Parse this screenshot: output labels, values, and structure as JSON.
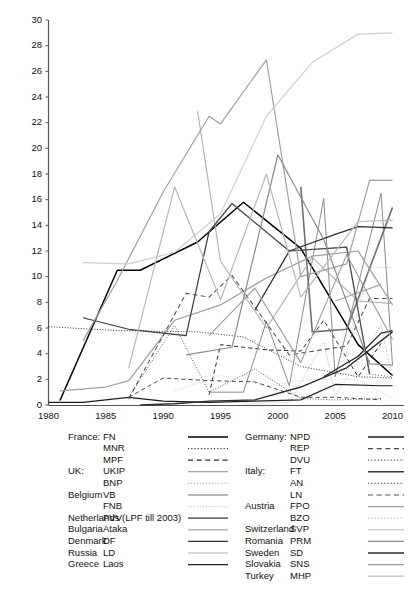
{
  "chart_data": {
    "type": "line",
    "title": "",
    "subtitle": "",
    "xlabel": "",
    "ylabel": "",
    "xlim": [
      1980,
      2011
    ],
    "ylim": [
      0,
      30
    ],
    "grid": false,
    "legend_position": "below",
    "xticks": [
      1980,
      1985,
      1990,
      1995,
      2000,
      2005,
      2010
    ],
    "yticks": [
      0,
      2,
      4,
      6,
      8,
      10,
      12,
      14,
      16,
      18,
      20,
      22,
      24,
      26,
      28,
      30
    ],
    "series": [
      {
        "name": "FN",
        "country": "France",
        "style": "solid",
        "color": "#000000",
        "width": 1.5,
        "points": [
          [
            1981,
            0.35
          ],
          [
            1986,
            10.5
          ],
          [
            1988,
            10.5
          ],
          [
            1993,
            12.7
          ],
          [
            1997,
            15.8
          ],
          [
            2002,
            12.2
          ],
          [
            2007,
            4.7
          ],
          [
            2010,
            2.3
          ]
        ]
      },
      {
        "name": "MNR",
        "country": "France",
        "style": "dotted",
        "color": "#333333",
        "width": 1.0,
        "points": [
          [
            1980,
            6.1
          ],
          [
            1986,
            5.8
          ],
          [
            1993,
            5.7
          ],
          [
            1997,
            5.3
          ],
          [
            2002,
            3.0
          ],
          [
            2007,
            2.2
          ],
          [
            2010,
            2.1
          ]
        ]
      },
      {
        "name": "MPF",
        "country": "France",
        "style": "dashed",
        "color": "#2a2a2a",
        "width": 1.0,
        "points": [
          [
            1994,
            0.8
          ],
          [
            1995,
            4.7
          ],
          [
            1999,
            4.3
          ],
          [
            2002,
            4.2
          ],
          [
            2004,
            6.6
          ],
          [
            2007,
            2.2
          ],
          [
            2009,
            4.8
          ]
        ]
      },
      {
        "name": "UKIP",
        "country": "UK",
        "style": "solid",
        "color": "#8a8a8a",
        "width": 1.0,
        "points": [
          [
            1994,
            1.0
          ],
          [
            1997,
            1.0
          ],
          [
            1999,
            6.5
          ],
          [
            2001,
            1.5
          ],
          [
            2004,
            16.1
          ],
          [
            2005,
            2.2
          ],
          [
            2009,
            16.5
          ],
          [
            2010,
            3.1
          ]
        ]
      },
      {
        "name": "BNP",
        "country": "UK",
        "style": "dotted",
        "color": "#b4b4b4",
        "width": 1.0,
        "points": [
          [
            1997,
            0.1
          ],
          [
            2001,
            0.2
          ],
          [
            2004,
            4.9
          ],
          [
            2005,
            0.7
          ],
          [
            2009,
            6.2
          ],
          [
            2010,
            1.9
          ]
        ]
      },
      {
        "name": "VB",
        "country": "Belgium",
        "style": "solid",
        "color": "#9e9e9e",
        "width": 1.2,
        "points": [
          [
            1981,
            1.1
          ],
          [
            1985,
            1.4
          ],
          [
            1987,
            1.9
          ],
          [
            1991,
            6.6
          ],
          [
            1995,
            7.8
          ],
          [
            1999,
            9.9
          ],
          [
            2003,
            11.6
          ],
          [
            2007,
            12.0
          ],
          [
            2010,
            7.8
          ]
        ]
      },
      {
        "name": "FNB",
        "country": "Belgium",
        "style": "dotted",
        "color": "#c8c8c8",
        "width": 1.0,
        "points": [
          [
            1991,
            1.1
          ],
          [
            1995,
            2.3
          ],
          [
            1999,
            1.5
          ],
          [
            2003,
            2.0
          ],
          [
            2007,
            2.0
          ],
          [
            2010,
            0.5
          ]
        ]
      },
      {
        "name": "PVV(LPF till 2003)",
        "country": "Netherlands",
        "style": "solid",
        "color": "#707070",
        "width": 1.6,
        "points": [
          [
            2002,
            17.0
          ],
          [
            2003,
            5.7
          ],
          [
            2006,
            5.9
          ],
          [
            2010,
            15.4
          ]
        ]
      },
      {
        "name": "Ataka",
        "country": "Bulgaria",
        "style": "solid",
        "color": "#a5a5a5",
        "width": 1.1,
        "points": [
          [
            2005,
            8.1
          ],
          [
            2009,
            9.4
          ]
        ]
      },
      {
        "name": "DF",
        "country": "Denmark",
        "style": "solid",
        "color": "#2e2e2e",
        "width": 1.3,
        "points": [
          [
            1998,
            7.4
          ],
          [
            2001,
            12.0
          ],
          [
            2005,
            13.3
          ],
          [
            2007,
            13.9
          ],
          [
            2010,
            13.8
          ]
        ]
      },
      {
        "name": "LD",
        "country": "Russia",
        "style": "solid",
        "color": "#b0b0b0",
        "width": 1.1,
        "points": [
          [
            1993,
            22.9
          ],
          [
            1995,
            11.2
          ],
          [
            1999,
            6.0
          ],
          [
            2003,
            11.5
          ],
          [
            2007,
            8.1
          ],
          [
            2010,
            7.9
          ]
        ]
      },
      {
        "name": "Laos",
        "country": "Greece",
        "style": "solid",
        "color": "#222222",
        "width": 1.3,
        "points": [
          [
            2004,
            2.2
          ],
          [
            2007,
            3.8
          ],
          [
            2009,
            5.6
          ],
          [
            2010,
            5.8
          ]
        ]
      },
      {
        "name": "NPD",
        "country": "Germany",
        "style": "solid",
        "color": "#1c1c1c",
        "width": 1.2,
        "points": [
          [
            1980,
            0.2
          ],
          [
            1983,
            0.2
          ],
          [
            1987,
            0.6
          ],
          [
            1990,
            0.3
          ],
          [
            1994,
            0.2
          ],
          [
            1998,
            0.3
          ],
          [
            2002,
            0.4
          ],
          [
            2005,
            1.6
          ],
          [
            2009,
            1.5
          ],
          [
            2010,
            1.5
          ]
        ]
      },
      {
        "name": "REP",
        "country": "Germany",
        "style": "dashed",
        "color": "#4a4a4a",
        "width": 1.0,
        "points": [
          [
            1987,
            0.6
          ],
          [
            1990,
            2.1
          ],
          [
            1994,
            1.9
          ],
          [
            1998,
            1.8
          ],
          [
            2002,
            0.6
          ],
          [
            2005,
            0.6
          ],
          [
            2009,
            0.4
          ]
        ]
      },
      {
        "name": "DVU",
        "country": "Germany",
        "style": "dotted",
        "color": "#5a5a5a",
        "width": 1.0,
        "points": [
          [
            1987,
            0.6
          ],
          [
            1991,
            6.2
          ],
          [
            1994,
            1.0
          ],
          [
            1998,
            2.8
          ],
          [
            2002,
            0.5
          ],
          [
            2005,
            0.4
          ],
          [
            2009,
            0.5
          ]
        ]
      },
      {
        "name": "FT",
        "country": "Italy",
        "style": "solid",
        "color": "#3a3a3a",
        "width": 1.2,
        "points": [
          [
            1983,
            6.8
          ],
          [
            1987,
            5.9
          ],
          [
            1992,
            5.4
          ],
          [
            1994,
            13.5
          ],
          [
            1996,
            15.7
          ],
          [
            2001,
            12.0
          ],
          [
            2006,
            12.3
          ],
          [
            2008,
            2.4
          ]
        ]
      },
      {
        "name": "AN",
        "country": "Italy",
        "style": "dotted",
        "color": "#6a6a6a",
        "width": 1.1,
        "points": [
          [
            1994,
            13.5
          ],
          [
            1996,
            15.7
          ],
          [
            2001,
            12.0
          ],
          [
            2006,
            12.3
          ],
          [
            2008,
            2.4
          ],
          [
            2010,
            2.2
          ]
        ]
      },
      {
        "name": "LN",
        "country": "Italy",
        "style": "dashed",
        "color": "#555555",
        "width": 1.1,
        "points": [
          [
            1987,
            0.5
          ],
          [
            1992,
            8.7
          ],
          [
            1994,
            8.4
          ],
          [
            1996,
            10.1
          ],
          [
            2001,
            3.9
          ],
          [
            2006,
            4.6
          ],
          [
            2008,
            8.3
          ],
          [
            2010,
            8.3
          ]
        ]
      },
      {
        "name": "FPO",
        "country": "Austria",
        "style": "solid",
        "color": "#a0a0a0",
        "width": 1.2,
        "points": [
          [
            1983,
            5.0
          ],
          [
            1986,
            9.7
          ],
          [
            1990,
            16.6
          ],
          [
            1994,
            22.5
          ],
          [
            1995,
            21.9
          ],
          [
            1999,
            26.9
          ],
          [
            2002,
            10.0
          ],
          [
            2006,
            11.0
          ],
          [
            2008,
            17.5
          ],
          [
            2010,
            17.5
          ]
        ]
      },
      {
        "name": "BZO",
        "country": "Austria",
        "style": "dotted",
        "color": "#bdbdbd",
        "width": 1.0,
        "points": [
          [
            2006,
            4.1
          ],
          [
            2008,
            10.7
          ],
          [
            2010,
            10.7
          ]
        ]
      },
      {
        "name": "SVP",
        "country": "Switzerland",
        "style": "solid",
        "color": "#cfcfcf",
        "width": 1.2,
        "points": [
          [
            1983,
            11.1
          ],
          [
            1987,
            11.0
          ],
          [
            1991,
            11.9
          ],
          [
            1995,
            14.9
          ],
          [
            1999,
            22.5
          ],
          [
            2003,
            26.7
          ],
          [
            2007,
            28.9
          ],
          [
            2010,
            29.0
          ]
        ]
      },
      {
        "name": "PRM",
        "country": "Romania",
        "style": "solid",
        "color": "#8c8c8c",
        "width": 1.2,
        "points": [
          [
            1992,
            3.9
          ],
          [
            1996,
            4.5
          ],
          [
            2000,
            19.5
          ],
          [
            2004,
            12.9
          ],
          [
            2008,
            3.2
          ],
          [
            2010,
            3.1
          ]
        ]
      },
      {
        "name": "SD",
        "country": "Sweden",
        "style": "solid",
        "color": "#2b2b2b",
        "width": 1.4,
        "points": [
          [
            1988,
            0.0
          ],
          [
            1991,
            0.1
          ],
          [
            1994,
            0.3
          ],
          [
            1998,
            0.4
          ],
          [
            2002,
            1.4
          ],
          [
            2006,
            2.9
          ],
          [
            2010,
            5.7
          ]
        ]
      },
      {
        "name": "SNS",
        "country": "Slovakia",
        "style": "solid",
        "color": "#9a9a9a",
        "width": 1.1,
        "points": [
          [
            1994,
            5.4
          ],
          [
            1998,
            9.1
          ],
          [
            2002,
            3.3
          ],
          [
            2006,
            11.7
          ],
          [
            2010,
            5.1
          ]
        ]
      },
      {
        "name": "MHP",
        "country": "Turkey",
        "style": "solid",
        "color": "#b8b8b8",
        "width": 1.2,
        "points": [
          [
            1987,
            2.9
          ],
          [
            1991,
            17.0
          ],
          [
            1995,
            8.2
          ],
          [
            1999,
            18.0
          ],
          [
            2002,
            8.4
          ],
          [
            2007,
            14.3
          ],
          [
            2010,
            14.4
          ]
        ]
      }
    ]
  },
  "axes": {
    "x_tick_labels": [
      "1980",
      "1985",
      "1990",
      "1995",
      "2000",
      "2005",
      "2010"
    ],
    "y_tick_labels": [
      "0",
      "2",
      "4",
      "6",
      "8",
      "10",
      "12",
      "14",
      "16",
      "18",
      "20",
      "22",
      "24",
      "26",
      "28",
      "30"
    ]
  },
  "legend": {
    "left_column": [
      {
        "country": "France:",
        "party": "FN",
        "style": "solid",
        "color": "#000000",
        "width": 1.7
      },
      {
        "country": "",
        "party": "MNR",
        "style": "dotted",
        "color": "#333333",
        "width": 1.2
      },
      {
        "country": "",
        "party": "MPF",
        "style": "dashed",
        "color": "#2a2a2a",
        "width": 1.2
      },
      {
        "country": "UK:",
        "party": "UKIP",
        "style": "solid",
        "color": "#8a8a8a",
        "width": 1.1
      },
      {
        "country": "",
        "party": "BNP",
        "style": "dotted",
        "color": "#b4b4b4",
        "width": 1.1
      },
      {
        "country": "Belgium",
        "party": "VB",
        "style": "solid",
        "color": "#9e9e9e",
        "width": 1.3
      },
      {
        "country": "",
        "party": "FNB",
        "style": "dotted",
        "color": "#c8c8c8",
        "width": 1.1
      },
      {
        "country": "Netherlands",
        "party": "PVV(LPF till 2003)",
        "style": "solid",
        "color": "#707070",
        "width": 1.8
      },
      {
        "country": "Bulgaria",
        "party": "Ataka",
        "style": "solid",
        "color": "#a5a5a5",
        "width": 1.2
      },
      {
        "country": "Denmark",
        "party": "DF",
        "style": "solid",
        "color": "#2e2e2e",
        "width": 1.4
      },
      {
        "country": "Russia",
        "party": "LD",
        "style": "solid",
        "color": "#b0b0b0",
        "width": 1.2
      },
      {
        "country": "Greece",
        "party": "Laos",
        "style": "solid",
        "color": "#222222",
        "width": 1.4
      }
    ],
    "right_column": [
      {
        "country": "Germany:",
        "party": "NPD",
        "style": "solid",
        "color": "#1c1c1c",
        "width": 1.4
      },
      {
        "country": "",
        "party": "REP",
        "style": "dashed",
        "color": "#4a4a4a",
        "width": 1.2
      },
      {
        "country": "",
        "party": "DVU",
        "style": "dotted",
        "color": "#5a5a5a",
        "width": 1.2
      },
      {
        "country": "Italy:",
        "party": "FT",
        "style": "solid",
        "color": "#3a3a3a",
        "width": 1.4
      },
      {
        "country": "",
        "party": "AN",
        "style": "dotted",
        "color": "#6a6a6a",
        "width": 1.2
      },
      {
        "country": "",
        "party": "LN",
        "style": "dashed",
        "color": "#555555",
        "width": 1.2
      },
      {
        "country": "Austria",
        "party": "FPO",
        "style": "solid",
        "color": "#a0a0a0",
        "width": 1.4
      },
      {
        "country": "",
        "party": "BZO",
        "style": "dotted",
        "color": "#bdbdbd",
        "width": 1.2
      },
      {
        "country": "Switzerland",
        "party": "SVP",
        "style": "solid",
        "color": "#cfcfcf",
        "width": 1.4
      },
      {
        "country": "Romania",
        "party": "PRM",
        "style": "solid",
        "color": "#8c8c8c",
        "width": 1.3
      },
      {
        "country": "Sweden",
        "party": "SD",
        "style": "solid",
        "color": "#2b2b2b",
        "width": 1.6
      },
      {
        "country": "Slovakia",
        "party": "SNS",
        "style": "solid",
        "color": "#9a9a9a",
        "width": 1.2
      },
      {
        "country": "Turkey",
        "party": "MHP",
        "style": "solid",
        "color": "#b8b8b8",
        "width": 1.3
      }
    ]
  }
}
